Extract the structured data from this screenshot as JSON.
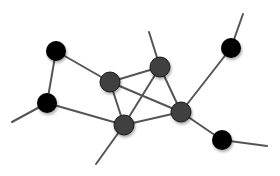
{
  "diagram": {
    "type": "network-graph",
    "width": 280,
    "height": 176,
    "colors": {
      "background": "#ffffff",
      "edge": "#555555",
      "node_black": "#050505",
      "node_gray": "#3f3f3f"
    },
    "nodes": [
      {
        "id": "n1",
        "x": 56,
        "y": 51,
        "r": 10,
        "style": "black"
      },
      {
        "id": "n2",
        "x": 47,
        "y": 103,
        "r": 10,
        "style": "black"
      },
      {
        "id": "n3",
        "x": 110,
        "y": 82,
        "r": 10,
        "style": "gray"
      },
      {
        "id": "n4",
        "x": 160,
        "y": 67,
        "r": 10,
        "style": "gray"
      },
      {
        "id": "n5",
        "x": 124,
        "y": 125,
        "r": 10,
        "style": "gray"
      },
      {
        "id": "n6",
        "x": 181,
        "y": 112,
        "r": 10,
        "style": "gray"
      },
      {
        "id": "n7",
        "x": 231,
        "y": 48,
        "r": 10,
        "style": "black"
      },
      {
        "id": "n8",
        "x": 222,
        "y": 140,
        "r": 10,
        "style": "black"
      }
    ],
    "edges": [
      {
        "from": "n1",
        "to": "n2"
      },
      {
        "from": "n1",
        "to": "n3"
      },
      {
        "from": "n2",
        "to": "n5"
      },
      {
        "from": "n3",
        "to": "n4"
      },
      {
        "from": "n3",
        "to": "n5"
      },
      {
        "from": "n3",
        "to": "n6"
      },
      {
        "from": "n4",
        "to": "n5"
      },
      {
        "from": "n4",
        "to": "n6"
      },
      {
        "from": "n5",
        "to": "n6"
      },
      {
        "from": "n6",
        "to": "n7"
      },
      {
        "from": "n6",
        "to": "n8"
      }
    ],
    "dangling_edges": [
      {
        "from": "n2",
        "x": 12,
        "y": 122
      },
      {
        "from": "n4",
        "x": 149,
        "y": 32
      },
      {
        "from": "n5",
        "x": 96,
        "y": 164
      },
      {
        "from": "n7",
        "x": 243,
        "y": 14
      },
      {
        "from": "n8",
        "x": 267,
        "y": 146
      }
    ]
  }
}
